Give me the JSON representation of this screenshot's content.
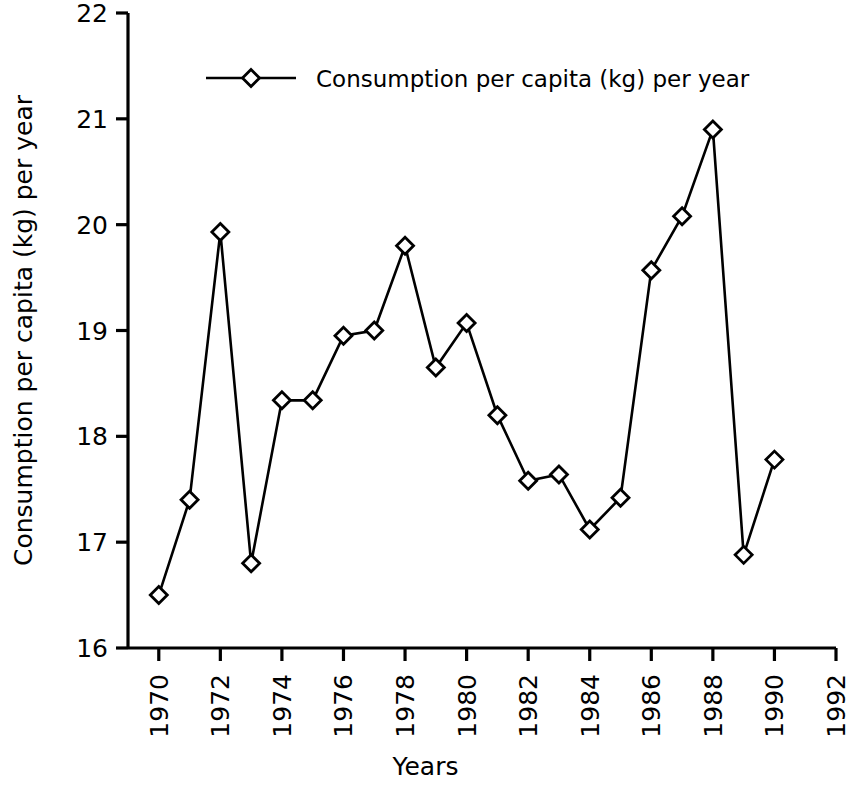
{
  "chart_data": {
    "type": "line",
    "title": "",
    "xlabel": "Years",
    "ylabel": "Consumption per capita (kg) per year",
    "legend": [
      "Consumption per capita (kg) per year"
    ],
    "legend_position": "top-left inside axes",
    "grid": false,
    "marker": "diamond-open",
    "line_color": "#000000",
    "marker_color": "#000000",
    "background_color": "#ffffff",
    "xlim": [
      1969,
      1992
    ],
    "ylim": [
      16,
      22
    ],
    "xticks": [
      1970,
      1972,
      1974,
      1976,
      1978,
      1980,
      1982,
      1984,
      1986,
      1988,
      1990,
      1992
    ],
    "xtick_labels": [
      "1970",
      "1972",
      "1974",
      "1976",
      "1978",
      "1980",
      "1982",
      "1984",
      "1986",
      "1988",
      "1990",
      "1992"
    ],
    "xtick_rotation": -90,
    "yticks": [
      16,
      17,
      18,
      19,
      20,
      21,
      22
    ],
    "ytick_labels": [
      "16",
      "17",
      "18",
      "19",
      "20",
      "21",
      "22"
    ],
    "x": [
      1970,
      1971,
      1972,
      1973,
      1974,
      1975,
      1976,
      1977,
      1978,
      1979,
      1980,
      1981,
      1982,
      1983,
      1984,
      1985,
      1986,
      1987,
      1988,
      1989,
      1990
    ],
    "values": [
      16.5,
      17.4,
      19.93,
      16.8,
      18.34,
      18.34,
      18.95,
      19.0,
      19.8,
      18.65,
      19.07,
      18.2,
      17.58,
      17.64,
      17.12,
      17.42,
      19.57,
      20.08,
      20.9,
      16.88,
      17.78
    ],
    "series": [
      {
        "name": "Consumption per capita (kg) per year",
        "values": [
          16.5,
          17.4,
          19.93,
          16.8,
          18.34,
          18.34,
          18.95,
          19.0,
          19.8,
          18.65,
          19.07,
          18.2,
          17.58,
          17.64,
          17.12,
          17.42,
          19.57,
          20.08,
          20.9,
          16.88,
          17.78
        ]
      }
    ]
  }
}
